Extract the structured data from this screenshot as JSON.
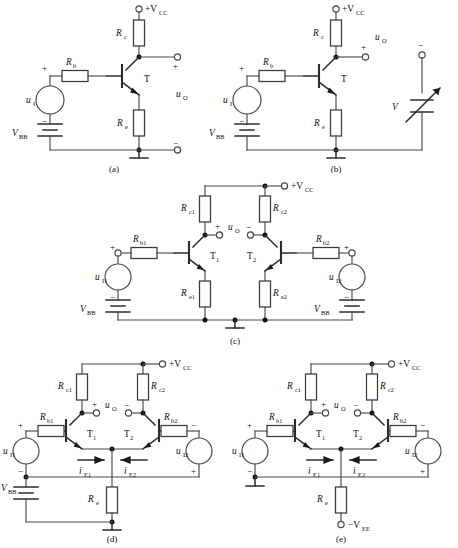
{
  "figure": {
    "background_color": "#ffffff",
    "line_color": "#4a4a4a",
    "device_color": "#2b2b2b"
  },
  "captions": {
    "a": "(a)",
    "b": "(b)",
    "c": "(c)",
    "d": "(d)",
    "e": "(e)"
  },
  "symbols": {
    "plus": "+",
    "minus": "−",
    "vcc": "+V",
    "vcc_sub": "CC",
    "vee": "−V",
    "vee_sub": "EE",
    "vbb": "V",
    "vbb_sub": "BB"
  },
  "panel_a": {
    "caption": "(a)",
    "supply_label": "+V",
    "supply_sub": "CC",
    "rc": {
      "label": "R",
      "sub": "c"
    },
    "re": {
      "label": "R",
      "sub": "e"
    },
    "rb": {
      "label": "R",
      "sub": "b"
    },
    "transistor": "T",
    "source_in": {
      "label": "u",
      "sub": "I"
    },
    "bias": {
      "label": "V",
      "sub": "BB"
    },
    "output": {
      "label": "u",
      "sub": "O"
    },
    "out_plus": "+",
    "out_minus": "−",
    "src_plus": "+",
    "src_minus": "−"
  },
  "panel_b": {
    "caption": "(b)",
    "supply_label": "+V",
    "supply_sub": "CC",
    "rc": {
      "label": "R",
      "sub": "c"
    },
    "re": {
      "label": "R",
      "sub": "e"
    },
    "rb": {
      "label": "R",
      "sub": "b"
    },
    "transistor": "T",
    "source_in": {
      "label": "u",
      "sub": "I"
    },
    "bias": {
      "label": "V",
      "sub": "BB"
    },
    "output": {
      "label": "u",
      "sub": "O"
    },
    "variable_load": {
      "label": "V"
    },
    "out_plus": "+",
    "out_minus": "−",
    "src_plus": "+",
    "src_minus": "−"
  },
  "panel_c": {
    "caption": "(c)",
    "supply_label": "+V",
    "supply_sub": "CC",
    "rc1": {
      "label": "R",
      "sub": "c1"
    },
    "rc2": {
      "label": "R",
      "sub": "c2"
    },
    "re1": {
      "label": "R",
      "sub": "e1"
    },
    "re2": {
      "label": "R",
      "sub": "e2"
    },
    "rb1": {
      "label": "R",
      "sub": "b1"
    },
    "rb2": {
      "label": "R",
      "sub": "b2"
    },
    "t1": {
      "label": "T",
      "sub": "1"
    },
    "t2": {
      "label": "T",
      "sub": "2"
    },
    "src1": {
      "label": "u",
      "sub": "I1"
    },
    "src2": {
      "label": "u",
      "sub": "I2"
    },
    "bias1": {
      "label": "V",
      "sub": "BB"
    },
    "bias2": {
      "label": "V",
      "sub": "BB"
    },
    "output": {
      "label": "u",
      "sub": "O"
    },
    "out_plus": "+",
    "out_minus": "−",
    "src1_plus": "+",
    "src1_minus": "−",
    "src2_plus": "+",
    "src2_minus": "−"
  },
  "panel_d": {
    "caption": "(d)",
    "supply_label": "+V",
    "supply_sub": "CC",
    "rc1": {
      "label": "R",
      "sub": "c1"
    },
    "rc2": {
      "label": "R",
      "sub": "c2"
    },
    "rb1": {
      "label": "R",
      "sub": "b1"
    },
    "rb2": {
      "label": "R",
      "sub": "b2"
    },
    "re": {
      "label": "R",
      "sub": "e"
    },
    "t1": {
      "label": "T",
      "sub": "1"
    },
    "t2": {
      "label": "T",
      "sub": "2"
    },
    "src1": {
      "label": "u",
      "sub": "I1"
    },
    "src2": {
      "label": "u",
      "sub": "I2"
    },
    "bias": {
      "label": "V",
      "sub": "BB"
    },
    "output": {
      "label": "u",
      "sub": "O"
    },
    "ie1": {
      "label": "i",
      "sub": "E1"
    },
    "ie2": {
      "label": "i",
      "sub": "E2"
    },
    "out_plus": "+",
    "out_minus": "−",
    "src1_plus": "+",
    "src1_minus": "−",
    "src2_plus": "+",
    "src2_minus": "−"
  },
  "panel_e": {
    "caption": "(e)",
    "supply_label": "+V",
    "supply_sub": "CC",
    "neg_supply_label": "−V",
    "neg_supply_sub": "EE",
    "rc1": {
      "label": "R",
      "sub": "c1"
    },
    "rc2": {
      "label": "R",
      "sub": "c2"
    },
    "rb1": {
      "label": "R",
      "sub": "b1"
    },
    "rb2": {
      "label": "R",
      "sub": "b2"
    },
    "re": {
      "label": "R",
      "sub": "e"
    },
    "t1": {
      "label": "T",
      "sub": "1"
    },
    "t2": {
      "label": "T",
      "sub": "2"
    },
    "src1": {
      "label": "u",
      "sub": "I1"
    },
    "src2": {
      "label": "u",
      "sub": "I2"
    },
    "output": {
      "label": "u",
      "sub": "O"
    },
    "ie1": {
      "label": "i",
      "sub": "E1"
    },
    "ie2": {
      "label": "i",
      "sub": "E2"
    },
    "out_plus": "+",
    "out_minus": "−",
    "src1_plus": "+",
    "src1_minus": "−",
    "src2_plus": "+",
    "src2_minus": "−"
  }
}
